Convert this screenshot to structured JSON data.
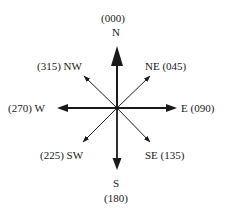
{
  "diagram": {
    "stroke_color": "#1a1a1a",
    "directions": {
      "north": {
        "letter": "N",
        "bearing": "(000)"
      },
      "northeast": {
        "label": "NE (045)"
      },
      "east": {
        "label": "E (090)"
      },
      "southeast": {
        "label": "SE (135)"
      },
      "south": {
        "letter": "S",
        "bearing": "(180)"
      },
      "southwest": {
        "label": "(225) SW"
      },
      "west": {
        "label": "(270) W"
      },
      "northwest": {
        "label": "(315) NW"
      }
    }
  }
}
